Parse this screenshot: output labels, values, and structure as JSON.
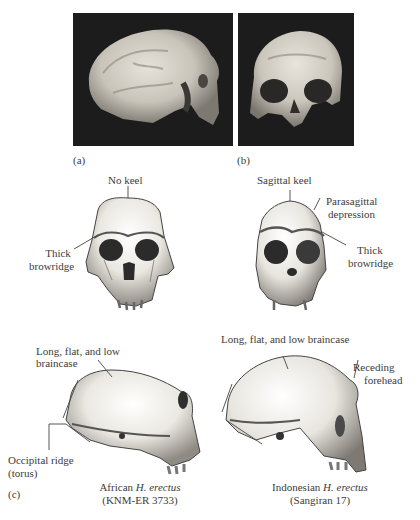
{
  "figure": {
    "panels": {
      "a": {
        "label": "(a)",
        "description": "Photograph of African H. erectus skull, lateral view"
      },
      "b": {
        "label": "(b)",
        "description": "Photograph of H. erectus skull, frontal view"
      },
      "c": {
        "label": "(c)"
      }
    },
    "frontal_left": {
      "annotations": {
        "keel": "No keel",
        "brow_line1": "Thick",
        "brow_line2": "browridge"
      }
    },
    "frontal_right": {
      "annotations": {
        "keel": "Sagittal keel",
        "para_line1": "Parasagittal",
        "para_line2": "depression",
        "brow_line1": "Thick",
        "brow_line2": "browridge"
      }
    },
    "lateral_left": {
      "annotations": {
        "braincase_line1": "Long, flat, and low",
        "braincase_line2": "braincase",
        "occipital_line1": "Occipital ridge",
        "occipital_line2": "(torus)"
      },
      "caption": {
        "prefix": "African ",
        "species": "H. erectus",
        "specimen": "(KNM-ER 3733)"
      }
    },
    "lateral_right": {
      "annotations": {
        "braincase": "Long, flat, and low braincase",
        "forehead_line1": "Receding",
        "forehead_line2": "forehead"
      },
      "caption": {
        "prefix": "Indonesian ",
        "species": "H. erectus",
        "specimen": "(Sangiran 17)"
      }
    }
  },
  "colors": {
    "photo_bg": "#1c1c1c",
    "bone": "#e8e4dc",
    "text": "#3c3c3c",
    "line": "#444444"
  }
}
